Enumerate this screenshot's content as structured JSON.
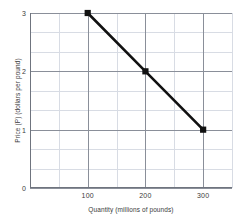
{
  "chart_data": {
    "type": "line",
    "title": "",
    "xlabel": "Quantity (millions of pounds)",
    "ylabel": "Price (P) (dollars per pound)",
    "xlim": [
      0,
      350
    ],
    "ylim": [
      0,
      3
    ],
    "xticks": [
      100,
      200,
      300
    ],
    "yticks": [
      0,
      1,
      2,
      3
    ],
    "xtick_labels": [
      "100",
      "200",
      "300"
    ],
    "ytick_labels": [
      "0",
      "1",
      "2",
      "3"
    ],
    "grid": true,
    "grid_minor": true,
    "legend": "none",
    "series": [
      {
        "name": "Demand",
        "color": "#111111",
        "marker": "square",
        "x": [
          100,
          200,
          300
        ],
        "y": [
          3,
          2,
          1
        ],
        "points": [
          {
            "x": 100,
            "y": 3
          },
          {
            "x": 200,
            "y": 2
          },
          {
            "x": 300,
            "y": 1
          }
        ]
      }
    ]
  },
  "colors": {
    "series_line": "#111111",
    "marker_fill": "#111111",
    "grid_minor": "#d8dce4",
    "grid_major": "#8a8f99",
    "axis": "#6f747e",
    "text": "#3b3b3b",
    "background": "#ffffff"
  }
}
